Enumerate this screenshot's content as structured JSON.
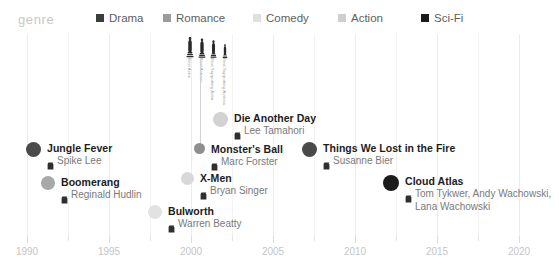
{
  "legend": {
    "title": "genre",
    "items": [
      {
        "label": "Drama",
        "color": "#3d3d3d",
        "x": 96
      },
      {
        "label": "Romance",
        "color": "#9b9b9b",
        "x": 163
      },
      {
        "label": "Comedy",
        "color": "#e0e0e0",
        "x": 253
      },
      {
        "label": "Action",
        "color": "#cfcfcf",
        "x": 338
      },
      {
        "label": "Sci-Fi",
        "color": "#1a1a1a",
        "x": 421
      }
    ]
  },
  "awards": {
    "icon_name": "oscar-statuette-icon",
    "items": [
      {
        "label": "Best Actor",
        "x": 0,
        "h": 22,
        "w": 8
      },
      {
        "label": "Best Actress",
        "x": 12,
        "h": 20,
        "w": 8
      },
      {
        "label": "Best Supporting Actor",
        "x": 23,
        "h": 18,
        "w": 9
      },
      {
        "label": "Best Supporting Actress",
        "x": 35,
        "h": 14,
        "w": 8
      }
    ]
  },
  "axis": {
    "ticks": [
      {
        "label": "1990",
        "x": 27,
        "major": true
      },
      {
        "label": "",
        "x": 68,
        "major": false
      },
      {
        "label": "1995",
        "x": 109,
        "major": true
      },
      {
        "label": "",
        "x": 150,
        "major": false
      },
      {
        "label": "2000",
        "x": 191,
        "major": true
      },
      {
        "label": "",
        "x": 232,
        "major": false
      },
      {
        "label": "2005",
        "x": 273,
        "major": true
      },
      {
        "label": "",
        "x": 314,
        "major": false
      },
      {
        "label": "2010",
        "x": 355,
        "major": true
      },
      {
        "label": "",
        "x": 396,
        "major": false
      },
      {
        "label": "2015",
        "x": 437,
        "major": true
      },
      {
        "label": "",
        "x": 478,
        "major": false
      },
      {
        "label": "2020",
        "x": 519,
        "major": true
      }
    ]
  },
  "chart_data": {
    "type": "scatter",
    "title": "",
    "xlabel": "",
    "ylabel": "",
    "xlim": [
      1990,
      2020
    ],
    "grid": true,
    "legend_position": "top",
    "films": [
      {
        "title": "Jungle Fever",
        "director": "Spike Lee",
        "genre": "Drama",
        "year": 1991,
        "color": "#4a4a4a",
        "size": 15,
        "x": 26,
        "y": 142
      },
      {
        "title": "Boomerang",
        "director": "Reginald Hudlin",
        "genre": "Romance",
        "year": 1992,
        "color": "#a8a8a8",
        "size": 14,
        "x": 41,
        "y": 176
      },
      {
        "title": "Bulworth",
        "director": "Warren Beatty",
        "genre": "Comedy",
        "year": 1998,
        "color": "#e2e2e2",
        "size": 14,
        "x": 148,
        "y": 205
      },
      {
        "title": "X-Men",
        "director": "Bryan Singer",
        "genre": "Comedy",
        "year": 2000,
        "color": "#d8d8d8",
        "size": 13,
        "x": 181,
        "y": 172
      },
      {
        "title": "Monster's Ball",
        "director": "Marc Forster",
        "genre": "Drama",
        "year": 2001,
        "color": "#8f8f8f",
        "size": 11,
        "x": 194,
        "y": 143
      },
      {
        "title": "Die Another Day",
        "director": "Lee Tamahori",
        "genre": "Action",
        "year": 2002,
        "color": "#d2d2d2",
        "size": 15,
        "x": 213,
        "y": 112
      },
      {
        "title": "Things We Lost in the Fire",
        "director": "Susanne Bier",
        "genre": "Drama",
        "year": 2007,
        "color": "#4a4a4a",
        "size": 15,
        "x": 302,
        "y": 142
      },
      {
        "title": "Cloud Atlas",
        "director": "Tom Tykwer, Andy Wachowski,",
        "director2": "Lana Wachowski",
        "genre": "Sci-Fi",
        "year": 2012,
        "color": "#1c1c1c",
        "size": 16,
        "x": 383,
        "y": 175
      }
    ]
  }
}
